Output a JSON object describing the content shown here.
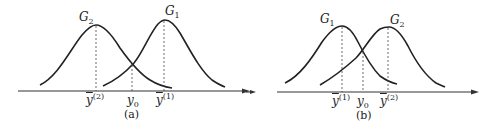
{
  "panels": [
    {
      "id": "a",
      "caption": "(a)",
      "curves": [
        {
          "label": "G",
          "sub": "2",
          "peak_x": 95,
          "role": "left"
        },
        {
          "label": "G",
          "sub": "1",
          "peak_x": 164,
          "role": "right"
        }
      ],
      "ticks": [
        {
          "base": "y",
          "sup": "(2)",
          "bar": true
        },
        {
          "base": "y",
          "sub": "0",
          "bar": false
        },
        {
          "base": "y",
          "sup": "(1)",
          "bar": true
        }
      ]
    },
    {
      "id": "b",
      "caption": "(b)",
      "curves": [
        {
          "label": "G",
          "sub": "1",
          "peak_x": 342,
          "role": "left"
        },
        {
          "label": "G",
          "sub": "2",
          "peak_x": 388,
          "role": "right"
        }
      ],
      "ticks": [
        {
          "base": "y",
          "sup": "(1)",
          "bar": true
        },
        {
          "base": "y",
          "sub": "0",
          "bar": false
        },
        {
          "base": "y",
          "sup": "(2)",
          "bar": true
        }
      ]
    }
  ],
  "colors": {
    "stroke": "#222222",
    "background": "#ffffff"
  }
}
